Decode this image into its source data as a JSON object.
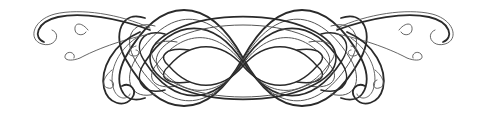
{
  "image": {
    "description": "Decorative calligraphic flourish ornament",
    "colors": {
      "background": "#ffffff",
      "ink": "#2a2a2a",
      "ink_light": "#555555"
    }
  }
}
